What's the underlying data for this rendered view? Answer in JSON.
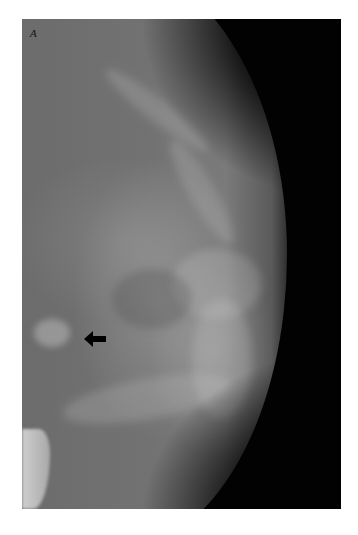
{
  "figure": {
    "panel_label": "A",
    "annotations": [
      {
        "type": "arrow",
        "direction": "left",
        "color": "#000000"
      }
    ],
    "colors": {
      "background": "#ffffff",
      "frame": "#020202",
      "tissue": "#6f6f6f"
    }
  }
}
